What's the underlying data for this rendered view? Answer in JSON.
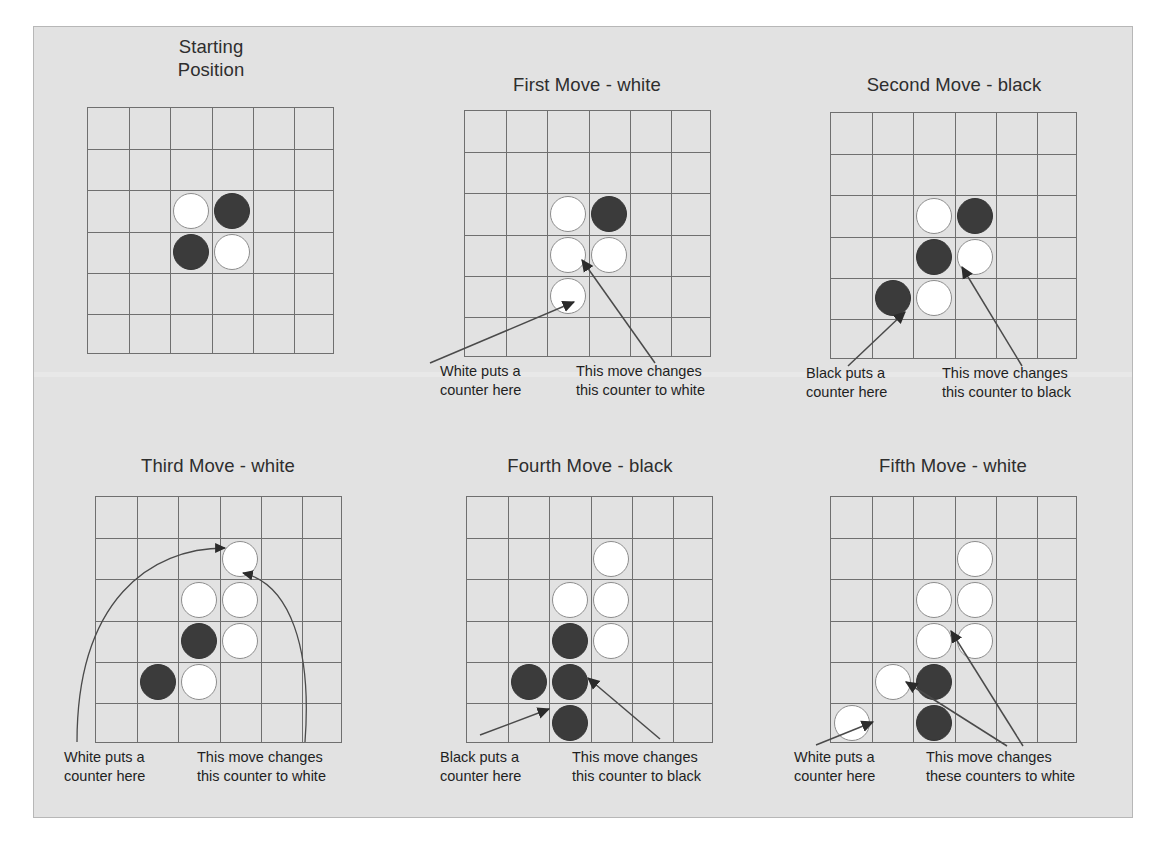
{
  "figure": {
    "kind": "othello-move-sequence",
    "background_color": "#ffffff",
    "panel_background_color": "#e2e2e2",
    "panel_border_color": "#b7b7b7",
    "board_line_color": "#6f6f6f",
    "white_piece_color": "#ffffff",
    "black_piece_color": "#3b3b3b",
    "arrow_color": "#4a4a4a",
    "board_rows": 6,
    "board_cols": 6
  },
  "panels": [
    {
      "id": "starting-position",
      "title": "Starting\nPosition",
      "pieces": [
        {
          "row": 2,
          "col": 2,
          "color": "white"
        },
        {
          "row": 2,
          "col": 3,
          "color": "black"
        },
        {
          "row": 3,
          "col": 2,
          "color": "black"
        },
        {
          "row": 3,
          "col": 3,
          "color": "white"
        }
      ],
      "captions": []
    },
    {
      "id": "first-move-white",
      "title": "First Move - white",
      "pieces": [
        {
          "row": 2,
          "col": 2,
          "color": "white"
        },
        {
          "row": 2,
          "col": 3,
          "color": "black"
        },
        {
          "row": 3,
          "col": 2,
          "color": "white"
        },
        {
          "row": 3,
          "col": 3,
          "color": "white"
        },
        {
          "row": 4,
          "col": 2,
          "color": "white"
        }
      ],
      "captions": [
        {
          "id": "place-caption",
          "text": "White puts a\ncounter here"
        },
        {
          "id": "flip-caption",
          "text": "This move changes\nthis counter to white"
        }
      ]
    },
    {
      "id": "second-move-black",
      "title": "Second Move - black",
      "pieces": [
        {
          "row": 2,
          "col": 2,
          "color": "white"
        },
        {
          "row": 2,
          "col": 3,
          "color": "black"
        },
        {
          "row": 3,
          "col": 2,
          "color": "black"
        },
        {
          "row": 3,
          "col": 3,
          "color": "white"
        },
        {
          "row": 4,
          "col": 1,
          "color": "black"
        },
        {
          "row": 4,
          "col": 2,
          "color": "white"
        }
      ],
      "captions": [
        {
          "id": "place-caption",
          "text": "Black puts a\ncounter here"
        },
        {
          "id": "flip-caption",
          "text": "This move changes\nthis counter to black"
        }
      ]
    },
    {
      "id": "third-move-white",
      "title": "Third Move - white",
      "pieces": [
        {
          "row": 1,
          "col": 3,
          "color": "white"
        },
        {
          "row": 2,
          "col": 2,
          "color": "white"
        },
        {
          "row": 2,
          "col": 3,
          "color": "white"
        },
        {
          "row": 3,
          "col": 2,
          "color": "black"
        },
        {
          "row": 3,
          "col": 3,
          "color": "white"
        },
        {
          "row": 4,
          "col": 1,
          "color": "black"
        },
        {
          "row": 4,
          "col": 2,
          "color": "white"
        }
      ],
      "captions": [
        {
          "id": "place-caption",
          "text": "White puts a\ncounter here"
        },
        {
          "id": "flip-caption",
          "text": "This move changes\nthis counter to white"
        }
      ]
    },
    {
      "id": "fourth-move-black",
      "title": "Fourth Move - black",
      "pieces": [
        {
          "row": 1,
          "col": 3,
          "color": "white"
        },
        {
          "row": 2,
          "col": 2,
          "color": "white"
        },
        {
          "row": 2,
          "col": 3,
          "color": "white"
        },
        {
          "row": 3,
          "col": 2,
          "color": "black"
        },
        {
          "row": 3,
          "col": 3,
          "color": "white"
        },
        {
          "row": 4,
          "col": 1,
          "color": "black"
        },
        {
          "row": 4,
          "col": 2,
          "color": "black"
        },
        {
          "row": 5,
          "col": 2,
          "color": "black"
        }
      ],
      "captions": [
        {
          "id": "place-caption",
          "text": "Black puts a\ncounter here"
        },
        {
          "id": "flip-caption",
          "text": "This move changes\nthis counter to black"
        }
      ]
    },
    {
      "id": "fifth-move-white",
      "title": "Fifth Move - white",
      "pieces": [
        {
          "row": 1,
          "col": 3,
          "color": "white"
        },
        {
          "row": 2,
          "col": 2,
          "color": "white"
        },
        {
          "row": 2,
          "col": 3,
          "color": "white"
        },
        {
          "row": 3,
          "col": 2,
          "color": "white"
        },
        {
          "row": 3,
          "col": 3,
          "color": "white"
        },
        {
          "row": 4,
          "col": 1,
          "color": "white"
        },
        {
          "row": 4,
          "col": 2,
          "color": "black"
        },
        {
          "row": 5,
          "col": 0,
          "color": "white"
        },
        {
          "row": 5,
          "col": 2,
          "color": "black"
        }
      ],
      "captions": [
        {
          "id": "place-caption",
          "text": "White puts a\ncounter here"
        },
        {
          "id": "flip-caption",
          "text": "This move changes\nthese counters to white"
        }
      ]
    }
  ]
}
